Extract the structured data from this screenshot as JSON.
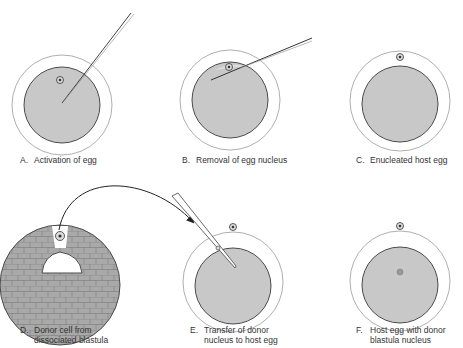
{
  "colors": {
    "cytoplasm": "#c8c8c8",
    "membrane": "#4a4a4a",
    "outer_envelope": "#9a9a9a",
    "blastula_cell": "#a8a8a8",
    "text": "#333333"
  },
  "panels": [
    {
      "letter": "A.",
      "line1": "Activation of egg",
      "line2": ""
    },
    {
      "letter": "B.",
      "line1": "Removal of egg nucleus",
      "line2": ""
    },
    {
      "letter": "C.",
      "line1": "Enucleated host egg",
      "line2": ""
    },
    {
      "letter": "D.",
      "line1": "Donor cell from",
      "line2": "dissociated blastula"
    },
    {
      "letter": "E.",
      "line1": "Transfer of donor",
      "line2": "nucleus to host egg"
    },
    {
      "letter": "F.",
      "line1": "Host egg with donor",
      "line2": "blastula nucleus"
    }
  ]
}
